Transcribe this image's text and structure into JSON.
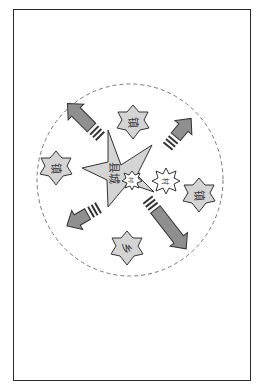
{
  "diagram": {
    "type": "county-town radiation diagram",
    "center": {
      "label": "县城",
      "shape": "five-point-star"
    },
    "nodes": [
      {
        "id": "town-top",
        "label": "镇",
        "shape": "six-point-star"
      },
      {
        "id": "town-left",
        "label": "镇",
        "shape": "six-point-star"
      },
      {
        "id": "town-right",
        "label": "镇",
        "shape": "six-point-star"
      },
      {
        "id": "township-bottom",
        "label": "乡",
        "shape": "six-point-star"
      },
      {
        "id": "village-center",
        "label": "村",
        "shape": "burst"
      },
      {
        "id": "village-right",
        "label": "村",
        "shape": "burst"
      }
    ],
    "arrows": [
      {
        "direction": "up-left"
      },
      {
        "direction": "up-right"
      },
      {
        "direction": "down-left"
      },
      {
        "direction": "down-right"
      }
    ],
    "boundary": {
      "shape": "dashed-circle"
    },
    "colors": {
      "fill_gray": "#d4d4d4",
      "arrow_gray": "#8f8f8f",
      "stroke": "#333333",
      "dash": "#777777"
    }
  }
}
